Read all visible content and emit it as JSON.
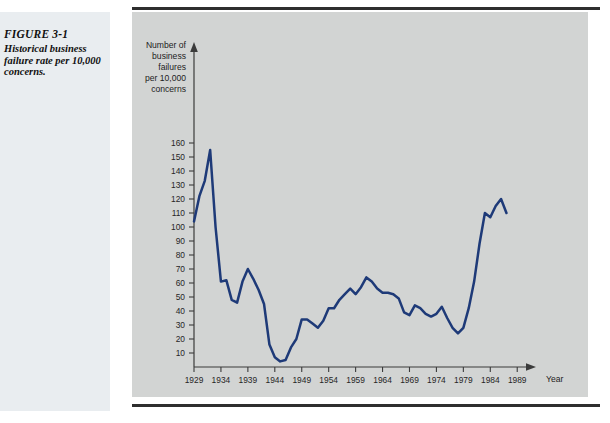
{
  "figure": {
    "label": "FIGURE 3-1",
    "caption": "Historical business failure rate per 10,000 concerns."
  },
  "chart_data": {
    "type": "line",
    "title": "",
    "xlabel": "Year",
    "ylabel": "Number of business failures per 10,000 concerns",
    "ylabel_lines": [
      "Number of",
      "business",
      "failures",
      "per 10,000",
      "concerns"
    ],
    "xlim": [
      1929,
      1991
    ],
    "ylim": [
      0,
      165
    ],
    "grid": false,
    "legend": null,
    "line_color": "#1e3a78",
    "background_color": "#d2d4d3",
    "xticks": [
      1929,
      1934,
      1939,
      1944,
      1949,
      1954,
      1959,
      1964,
      1969,
      1974,
      1979,
      1984,
      1989
    ],
    "yticks": [
      10,
      20,
      30,
      40,
      50,
      60,
      70,
      80,
      90,
      100,
      110,
      120,
      130,
      140,
      150,
      160
    ],
    "series": [
      {
        "name": "Business failure rate per 10,000 concerns",
        "x": [
          1929,
          1930,
          1931,
          1932,
          1933,
          1934,
          1935,
          1936,
          1937,
          1938,
          1939,
          1940,
          1941,
          1942,
          1943,
          1944,
          1945,
          1946,
          1947,
          1948,
          1949,
          1950,
          1951,
          1952,
          1953,
          1954,
          1955,
          1956,
          1957,
          1958,
          1959,
          1960,
          1961,
          1962,
          1963,
          1964,
          1965,
          1966,
          1967,
          1968,
          1969,
          1970,
          1971,
          1972,
          1973,
          1974,
          1975,
          1976,
          1977,
          1978,
          1979,
          1980,
          1981,
          1982,
          1983,
          1984,
          1985,
          1986,
          1987
        ],
        "values": [
          104,
          122,
          133,
          155,
          100,
          61,
          62,
          48,
          46,
          61,
          70,
          63,
          55,
          45,
          16,
          7,
          4,
          5,
          14,
          20,
          34,
          34,
          31,
          28,
          33,
          42,
          42,
          48,
          52,
          56,
          52,
          57,
          64,
          61,
          56,
          53,
          53,
          52,
          49,
          39,
          37,
          44,
          42,
          38,
          36,
          38,
          43,
          35,
          28,
          24,
          28,
          42,
          61,
          88,
          110,
          107,
          115,
          120,
          110
        ]
      }
    ]
  }
}
